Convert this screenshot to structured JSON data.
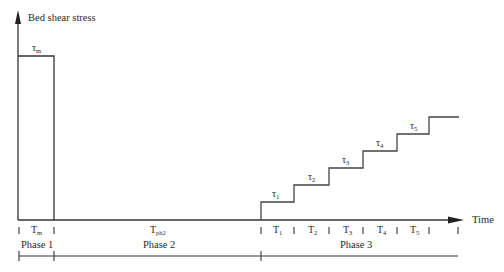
{
  "diagram": {
    "y_axis_label": "Bed shear stress",
    "x_axis_label": "Time",
    "phase1": {
      "stress_symbol": "τ",
      "stress_subscript": "m",
      "duration_symbol": "T",
      "duration_subscript": "m",
      "label": "Phase 1"
    },
    "phase2": {
      "duration_symbol": "T",
      "duration_subscript": "ph2",
      "label": "Phase 2"
    },
    "phase3": {
      "label": "Phase 3",
      "steps": [
        {
          "stress_symbol": "τ",
          "stress_subscript": "1",
          "duration_symbol": "T",
          "duration_subscript": "1"
        },
        {
          "stress_symbol": "τ",
          "stress_subscript": "2",
          "duration_symbol": "T",
          "duration_subscript": "2"
        },
        {
          "stress_symbol": "τ",
          "stress_subscript": "3",
          "duration_symbol": "T",
          "duration_subscript": "3"
        },
        {
          "stress_symbol": "τ",
          "stress_subscript": "4",
          "duration_symbol": "T",
          "duration_subscript": "4"
        },
        {
          "stress_symbol": "τ",
          "stress_subscript": "5",
          "duration_symbol": "T",
          "duration_subscript": "5"
        }
      ]
    },
    "colors": {
      "line": "#333333",
      "text": "#2a2a2a",
      "background": "#ffffff"
    }
  }
}
